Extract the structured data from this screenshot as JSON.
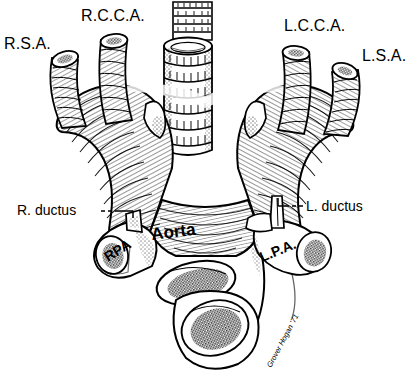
{
  "figure": {
    "medium": "pen-and-ink line engraving",
    "background_color": "#ffffff",
    "ink_color": "#000000"
  },
  "labels": {
    "right_subclavian": "R.S.A.",
    "right_common_carotid": "R.C.C.A.",
    "left_common_carotid": "L.C.C.A.",
    "left_subclavian": "L.S.A.",
    "right_ductus": "R. ductus",
    "left_ductus": "L. ductus",
    "right_pulmonary_artery": "RPA",
    "left_pulmonary_artery": "L.P.A.",
    "aorta": "Aorta"
  },
  "signature": {
    "text": "Grover Hogan '71"
  },
  "structures": [
    {
      "name": "trachea",
      "description": "central vertical airway with cartilage rings"
    },
    {
      "name": "right-arch",
      "description": "right aortic arch limb"
    },
    {
      "name": "left-arch",
      "description": "left aortic arch limb"
    },
    {
      "name": "descending-aorta",
      "description": "cut stump, stippled lumen"
    },
    {
      "name": "ascending-aorta",
      "description": "cut stump, stippled lumen"
    }
  ]
}
